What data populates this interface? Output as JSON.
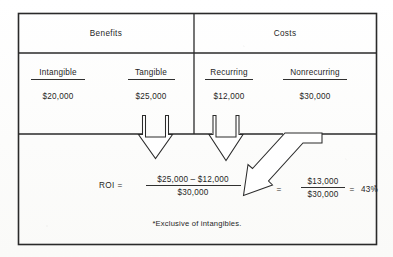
{
  "figure": {
    "type": "roi-calculation-table-diagram",
    "headers": {
      "benefits": "Benefits",
      "costs": "Costs"
    },
    "columns": [
      {
        "name": "intangible",
        "label": "Intangible",
        "amount": "$20,000",
        "group": "Benefits"
      },
      {
        "name": "tangible",
        "label": "Tangible",
        "amount": "$25,000",
        "group": "Benefits"
      },
      {
        "name": "recurring",
        "label": "Recurring",
        "amount": "$12,000",
        "group": "Costs"
      },
      {
        "name": "nonrecurring",
        "label": "Nonrecurring",
        "amount": "$30,000",
        "group": "Costs"
      }
    ],
    "formula": {
      "roi_label": "ROI =",
      "numerator": "$25,000 – $12,000",
      "denominator": "$30,000",
      "equals": "=",
      "result_numerator": "$13,000",
      "result_denominator": "$30,000",
      "result_equals": "=",
      "result": "43%",
      "result_star": "*"
    },
    "footnote": "*Exclusive of intangibles.",
    "arrows": [
      {
        "name": "tangible-down-arrow",
        "direction": "down"
      },
      {
        "name": "recurring-down-arrow",
        "direction": "down"
      },
      {
        "name": "nonrecurring-diagonal-arrow",
        "direction": "down-left"
      }
    ],
    "colors": {
      "ink": "#2a2a2a",
      "paper": "#fdfdfc",
      "text": "#1f1f1f"
    }
  }
}
